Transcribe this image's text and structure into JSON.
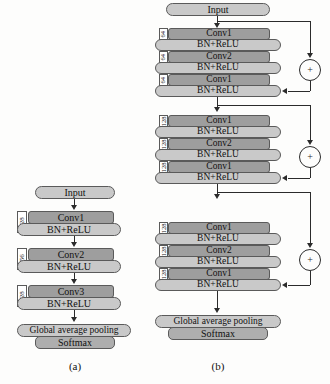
{
  "figure": {
    "panels": [
      {
        "id": "a",
        "caption": "(a)",
        "blocks": [
          {
            "nodes": [
              {
                "type": "input",
                "label": "Input"
              }
            ]
          },
          {
            "channels": "128",
            "nodes": [
              {
                "type": "conv",
                "label": "Conv1"
              },
              {
                "type": "bn",
                "label": "BN+ReLU"
              }
            ]
          },
          {
            "channels": "256",
            "nodes": [
              {
                "type": "conv",
                "label": "Conv2"
              },
              {
                "type": "bn",
                "label": "BN+ReLU"
              }
            ]
          },
          {
            "channels": "128",
            "nodes": [
              {
                "type": "conv",
                "label": "Conv3"
              },
              {
                "type": "bn",
                "label": "BN+ReLU"
              }
            ]
          },
          {
            "nodes": [
              {
                "type": "pool",
                "label": "Global average pooling"
              },
              {
                "type": "softmax",
                "label": "Softmax"
              }
            ]
          }
        ]
      },
      {
        "id": "b",
        "caption": "(b)",
        "blocks": [
          {
            "nodes": [
              {
                "type": "input",
                "label": "Input"
              }
            ]
          },
          {
            "residual": true,
            "adder": "+",
            "layers": [
              {
                "channels": "64",
                "conv": "Conv1",
                "bn": "BN+ReLU"
              },
              {
                "channels": "64",
                "conv": "Conv2",
                "bn": "BN+ReLU"
              },
              {
                "channels": "64",
                "conv": "Conv1",
                "bn": "BN+ReLU"
              }
            ]
          },
          {
            "residual": true,
            "adder": "+",
            "layers": [
              {
                "channels": "128",
                "conv": "Conv1",
                "bn": "BN+ReLU"
              },
              {
                "channels": "128",
                "conv": "Conv2",
                "bn": "BN+ReLU"
              },
              {
                "channels": "128",
                "conv": "Conv1",
                "bn": "BN+ReLU"
              }
            ]
          },
          {
            "residual": true,
            "adder": "+",
            "layers": [
              {
                "channels": "128",
                "conv": "Conv1",
                "bn": "BN+ReLU"
              },
              {
                "channels": "128",
                "conv": "Conv2",
                "bn": "BN+ReLU"
              },
              {
                "channels": "128",
                "conv": "Conv1",
                "bn": "BN+ReLU"
              }
            ]
          },
          {
            "nodes": [
              {
                "type": "pool",
                "label": "Global average pooling"
              },
              {
                "type": "softmax",
                "label": "Softmax"
              }
            ]
          }
        ]
      }
    ]
  },
  "colors": {
    "conv_fill": "#9e9e9e",
    "bn_fill": "#c9c9c9",
    "softmax_fill": "#aeaeae",
    "stroke": "#5a5a5a",
    "line": "#2b2b2b",
    "background": "#fdfdfc"
  }
}
